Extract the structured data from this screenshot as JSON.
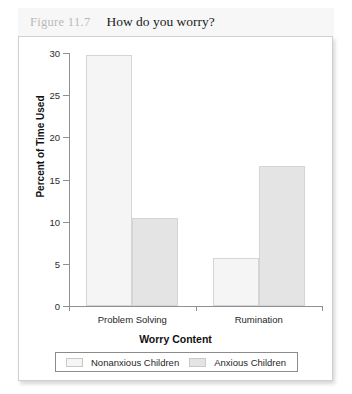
{
  "caption": {
    "number": "Figure 11.7",
    "title": "How do you worry?"
  },
  "chart_data": {
    "type": "bar",
    "title": "How do you worry?",
    "xlabel": "Worry Content",
    "ylabel": "Percent of Time Used",
    "categories": [
      "Problem Solving",
      "Rumination"
    ],
    "series": [
      {
        "name": "Nonanxious Children",
        "values": [
          29.8,
          5.7
        ],
        "color": "#f5f5f5"
      },
      {
        "name": "Anxious Children",
        "values": [
          10.4,
          16.6
        ],
        "color": "#e4e4e4"
      }
    ],
    "ylim": [
      0,
      30
    ],
    "yticks": [
      0,
      5,
      10,
      15,
      20,
      25,
      30
    ],
    "ytick_labels": [
      "0",
      "5",
      "10",
      "15",
      "20",
      "25",
      "30"
    ],
    "grid": false,
    "legend_position": "bottom"
  },
  "colors": {
    "axis": "#909090",
    "text": "#1f1f1f",
    "caption_number": "#b9b9b9",
    "panel_border": "#d0d0d0",
    "caption_band": "#f7f7f7"
  }
}
